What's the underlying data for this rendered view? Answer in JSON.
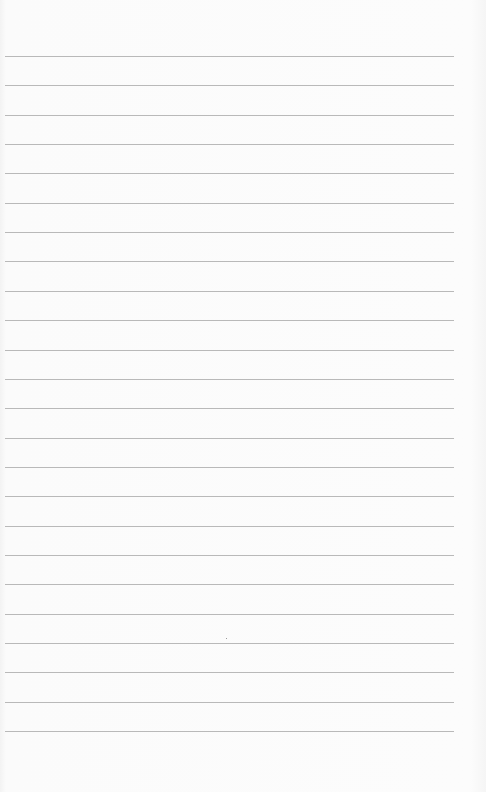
{
  "page": {
    "type": "lined-paper",
    "background_color": "#fafafa",
    "line_color": "#b9b9b9",
    "line_count": 24,
    "first_line_y": 56,
    "line_spacing": 29.35,
    "line_left": 5,
    "line_width": 449
  }
}
